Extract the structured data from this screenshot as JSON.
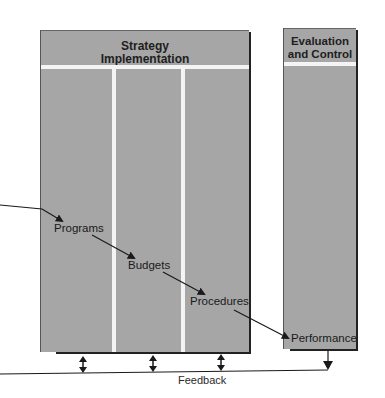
{
  "diagram": {
    "panels": {
      "strategy_implementation": {
        "title_line1": "Strategy",
        "title_line2": "Implementation"
      },
      "evaluation_control": {
        "title_line1": "Evaluation",
        "title_line2": "and Control"
      }
    },
    "nodes": {
      "programs": "Programs",
      "budgets": "Budgets",
      "procedures": "Procedures",
      "performance": "Performance"
    },
    "feedback_label": "Feedback",
    "colors": {
      "panel_fill": "#a6a6a6",
      "divider": "#f4f4f4",
      "text": "#1a1a1a",
      "line": "#222222"
    }
  }
}
